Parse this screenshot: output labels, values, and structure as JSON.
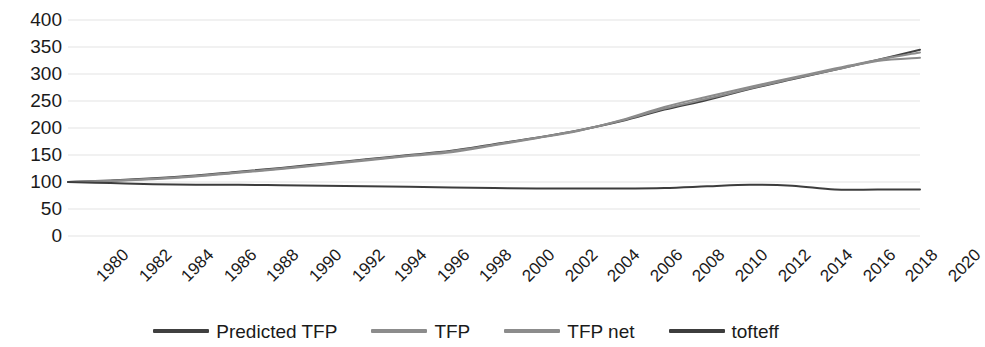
{
  "chart_data": {
    "type": "line",
    "title": "",
    "xlabel": "",
    "ylabel": "",
    "grid": true,
    "legend_position": "bottom",
    "ylim": [
      0,
      400
    ],
    "ytick_labels": [
      "400",
      "350",
      "300",
      "250",
      "200",
      "150",
      "100",
      "50",
      "0"
    ],
    "ytick_values": [
      400,
      350,
      300,
      250,
      200,
      150,
      100,
      50,
      0
    ],
    "xlim": [
      1980,
      2020
    ],
    "categories": [
      1980,
      1982,
      1984,
      1986,
      1988,
      1990,
      1992,
      1994,
      1996,
      1998,
      2000,
      2002,
      2004,
      2006,
      2008,
      2010,
      2012,
      2014,
      2016,
      2018,
      2020
    ],
    "xtick_labels": [
      "1980",
      "1982",
      "1984",
      "1986",
      "1988",
      "1990",
      "1992",
      "1994",
      "1996",
      "1998",
      "2000",
      "2002",
      "2004",
      "2006",
      "2008",
      "2010",
      "2012",
      "2014",
      "2016",
      "2018",
      "2020"
    ],
    "series": [
      {
        "name": "Predicted TFP",
        "color": "#404040",
        "values": [
          100,
          103,
          107,
          112,
          119,
          126,
          134,
          142,
          150,
          158,
          170,
          182,
          196,
          213,
          234,
          252,
          272,
          290,
          308,
          326,
          345
        ]
      },
      {
        "name": "TFP",
        "color": "#8c8c8c",
        "values": [
          100,
          102,
          105,
          110,
          117,
          124,
          132,
          140,
          148,
          155,
          168,
          181,
          195,
          215,
          239,
          258,
          276,
          293,
          310,
          326,
          340
        ]
      },
      {
        "name": "TFP net",
        "color": "#8c8c8c",
        "values": [
          100,
          102,
          106,
          111,
          118,
          125,
          133,
          141,
          149,
          157,
          169,
          182,
          196,
          214,
          236,
          254,
          273,
          291,
          308,
          324,
          330
        ]
      },
      {
        "name": "tofteff",
        "color": "#3d3d3d",
        "values": [
          100,
          98,
          96,
          95,
          95,
          94,
          93,
          92,
          91,
          90,
          89,
          88,
          88,
          88,
          89,
          92,
          95,
          93,
          86,
          86,
          86
        ]
      }
    ]
  },
  "legend": {
    "items": [
      {
        "label": "Predicted TFP",
        "color": "#404040"
      },
      {
        "label": "TFP",
        "color": "#8c8c8c"
      },
      {
        "label": "TFP net",
        "color": "#8c8c8c"
      },
      {
        "label": "tofteff",
        "color": "#3d3d3d"
      }
    ]
  },
  "axis": {
    "gridline_color": "#e3e3e3",
    "text_color": "#1a1a1a"
  }
}
